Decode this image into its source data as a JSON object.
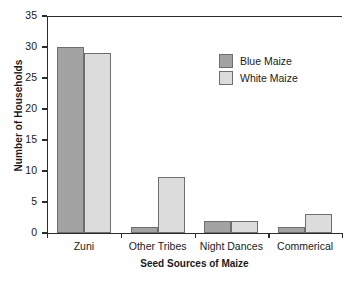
{
  "chart_data": {
    "type": "bar",
    "title": "",
    "xlabel": "Seed Sources of Maize",
    "ylabel": "Number of Households",
    "categories": [
      "Zuni",
      "Other Tribes",
      "Night Dances",
      "Commerical"
    ],
    "series": [
      {
        "name": "Blue Maize",
        "color": "#a3a3a3",
        "values": [
          30,
          1,
          2,
          1
        ]
      },
      {
        "name": "White Maize",
        "color": "#dcdcdc",
        "values": [
          29,
          9,
          2,
          3
        ]
      }
    ],
    "ylim": [
      0,
      35
    ],
    "yticks": [
      0,
      5,
      10,
      15,
      20,
      25,
      30,
      35
    ],
    "ytick_labels": [
      "0",
      "5",
      "10",
      "15",
      "20",
      "25",
      "30",
      "35"
    ],
    "grid": false,
    "legend_position": "upper-right-inside",
    "axis_color": "#2b2b2b",
    "bar_edge_color": "#6e6e6e",
    "background": "#ffffff"
  }
}
